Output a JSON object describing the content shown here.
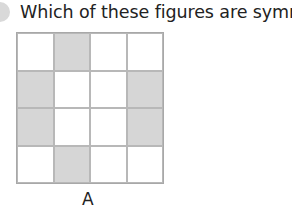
{
  "question": {
    "text": "Which of these figures are symmetric?"
  },
  "figure": {
    "label": "A",
    "rows": 4,
    "cols": 4,
    "shaded_cells": [
      [
        0,
        1
      ],
      [
        1,
        0
      ],
      [
        1,
        3
      ],
      [
        2,
        0
      ],
      [
        2,
        3
      ],
      [
        3,
        1
      ]
    ],
    "colors": {
      "shaded": "#d6d6d6",
      "empty": "#ffffff",
      "border": "#b8b8b8"
    }
  }
}
